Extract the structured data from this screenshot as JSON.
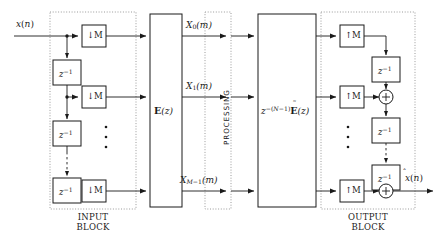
{
  "diagram": {
    "input_signal": "x(n)",
    "output_signal": "x̂(n)",
    "input_block_label_line1": "INPUT",
    "input_block_label_line2": "BLOCK",
    "output_block_label_line1": "OUTPUT",
    "output_block_label_line2": "BLOCK",
    "processing_label": "PROCESSING",
    "analysis_matrix_label": "E(z)",
    "synthesis_matrix_label": "z^-(N-1) Ẽ(z)",
    "downsampler_label": "↓M",
    "upsampler_label": "↑M",
    "delay_label": "z^-1",
    "adder_symbol": "+",
    "ellipsis_symbol": "⋮",
    "subband_signals": [
      {
        "label": "X0(m)",
        "index": 0
      },
      {
        "label": "X1(m)",
        "index": 1
      },
      {
        "label": "XM-1(m)",
        "index": 2
      }
    ],
    "channels": {
      "count_visible": 3,
      "total": "M"
    },
    "colors": {
      "background": "#ffffff",
      "line": "#1a1a1a",
      "box_stroke": "#1a1a1a",
      "box_fill": "#ffffff",
      "dotted_border": "#8c8c8c",
      "text": "#1a1a1a"
    }
  }
}
